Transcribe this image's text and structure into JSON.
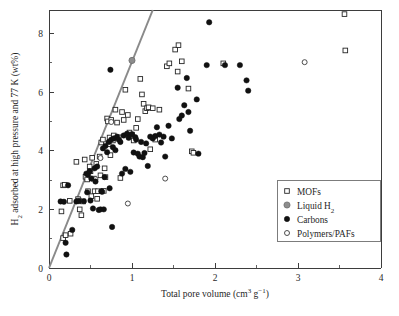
{
  "figure": {
    "background": "#ffffff",
    "plot_area": {
      "left": 49,
      "top": 10,
      "right": 381,
      "bottom": 268
    }
  },
  "chart_data": {
    "type": "scatter",
    "title": "",
    "xlabel": "Total pore volume (cm3 g-1)",
    "xlabel_parts": {
      "base": "Total pore volume (cm",
      "sup1": "3",
      "mid": " g",
      "sup2": "−1",
      "tail": ")"
    },
    "ylabel": "H2 adsorbed at high pressure and 77 K (wt%)",
    "ylabel_parts": {
      "lead": "H",
      "sub": "2",
      "rest": " adsorbed at high pressure and 77 K (wt%)"
    },
    "xlim": [
      0,
      4
    ],
    "ylim": [
      0,
      8.8
    ],
    "xticks": [
      0,
      1,
      2,
      3,
      4
    ],
    "xticklabels": [
      "0",
      "1",
      "2",
      "3",
      "4"
    ],
    "xminorticks": [
      0.5,
      1.5,
      2.5,
      3.5
    ],
    "yticks": [
      0,
      2,
      4,
      6,
      8
    ],
    "yticklabels": [
      "0",
      "2",
      "4",
      "6",
      "8"
    ],
    "yminorticks": [
      1,
      3,
      5,
      7
    ],
    "grid": false,
    "legend_position": "lower-right",
    "reference_line": {
      "name": "chahine-rule-line",
      "color": "#8a8a8a",
      "x": [
        0,
        1.25
      ],
      "y": [
        0,
        8.8
      ]
    },
    "series": [
      {
        "name": "MOFs",
        "marker": "open-square",
        "color": "#ffffff",
        "edge": "#262626",
        "points": [
          [
            0.15,
            1.93
          ],
          [
            0.17,
            2.82
          ],
          [
            0.19,
            2.84
          ],
          [
            0.17,
            1.02
          ],
          [
            0.2,
            1.12
          ],
          [
            0.25,
            2.29
          ],
          [
            0.26,
            1.17
          ],
          [
            0.33,
            3.62
          ],
          [
            0.35,
            2.35
          ],
          [
            0.36,
            2.3
          ],
          [
            0.37,
            2.0
          ],
          [
            0.39,
            1.8
          ],
          [
            0.41,
            2.27
          ],
          [
            0.43,
            3.7
          ],
          [
            0.44,
            3.11
          ],
          [
            0.46,
            3.02
          ],
          [
            0.47,
            2.62
          ],
          [
            0.49,
            3.46
          ],
          [
            0.5,
            3.3
          ],
          [
            0.51,
            2.45
          ],
          [
            0.52,
            3.76
          ],
          [
            0.54,
            3.05
          ],
          [
            0.55,
            2.62
          ],
          [
            0.57,
            3.55
          ],
          [
            0.58,
            2.36
          ],
          [
            0.59,
            2.62
          ],
          [
            0.61,
            3.8
          ],
          [
            0.62,
            3.16
          ],
          [
            0.63,
            4.28
          ],
          [
            0.65,
            4.38
          ],
          [
            0.66,
            2.63
          ],
          [
            0.67,
            3.4
          ],
          [
            0.68,
            3.1
          ],
          [
            0.7,
            5.1
          ],
          [
            0.71,
            5.0
          ],
          [
            0.72,
            4.22
          ],
          [
            0.73,
            4.45
          ],
          [
            0.74,
            3.85
          ],
          [
            0.75,
            5.05
          ],
          [
            0.77,
            4.35
          ],
          [
            0.78,
            4.52
          ],
          [
            0.8,
            5.4
          ],
          [
            0.82,
            4.96
          ],
          [
            0.84,
            4.46
          ],
          [
            0.86,
            3.07
          ],
          [
            0.88,
            5.32
          ],
          [
            0.9,
            5.05
          ],
          [
            0.92,
            6.08
          ],
          [
            0.95,
            5.22
          ],
          [
            0.97,
            4.62
          ],
          [
            1.0,
            4.55
          ],
          [
            1.02,
            4.35
          ],
          [
            1.05,
            4.78
          ],
          [
            1.07,
            5.08
          ],
          [
            1.1,
            6.45
          ],
          [
            1.12,
            5.92
          ],
          [
            1.14,
            5.6
          ],
          [
            1.16,
            5.35
          ],
          [
            1.18,
            5.45
          ],
          [
            1.2,
            5.48
          ],
          [
            1.22,
            4.05
          ],
          [
            1.25,
            5.45
          ],
          [
            1.28,
            4.38
          ],
          [
            1.33,
            5.4
          ],
          [
            1.42,
            6.88
          ],
          [
            1.45,
            6.98
          ],
          [
            1.52,
            7.45
          ],
          [
            1.55,
            6.7
          ],
          [
            1.56,
            7.6
          ],
          [
            1.6,
            7.05
          ],
          [
            1.68,
            6.12
          ],
          [
            1.72,
            3.98
          ],
          [
            1.74,
            3.93
          ],
          [
            2.1,
            6.98
          ],
          [
            3.56,
            8.66
          ],
          [
            3.57,
            7.42
          ]
        ]
      },
      {
        "name": "Liquid H2",
        "marker": "filled-circle-gray",
        "color": "#8d8d8d",
        "points": [
          [
            1.0,
            7.08
          ]
        ]
      },
      {
        "name": "Carbons",
        "marker": "filled-circle",
        "color": "#111111",
        "points": [
          [
            0.14,
            2.27
          ],
          [
            0.18,
            2.26
          ],
          [
            0.2,
            0.86
          ],
          [
            0.21,
            0.46
          ],
          [
            0.23,
            2.82
          ],
          [
            0.28,
            1.3
          ],
          [
            0.33,
            2.27
          ],
          [
            0.36,
            2.28
          ],
          [
            0.42,
            2.28
          ],
          [
            0.45,
            3.22
          ],
          [
            0.46,
            2.58
          ],
          [
            0.47,
            3.18
          ],
          [
            0.49,
            3.3
          ],
          [
            0.5,
            2.3
          ],
          [
            0.51,
            3.05
          ],
          [
            0.53,
            2.03
          ],
          [
            0.55,
            3.4
          ],
          [
            0.56,
            2.95
          ],
          [
            0.58,
            3.46
          ],
          [
            0.6,
            1.98
          ],
          [
            0.62,
            2.0
          ],
          [
            0.63,
            2.62
          ],
          [
            0.64,
            2.6
          ],
          [
            0.65,
            4.08
          ],
          [
            0.66,
            2.0
          ],
          [
            0.67,
            3.1
          ],
          [
            0.68,
            4.16
          ],
          [
            0.7,
            3.95
          ],
          [
            0.72,
            4.3
          ],
          [
            0.73,
            2.72
          ],
          [
            0.74,
            6.76
          ],
          [
            0.75,
            4.38
          ],
          [
            0.76,
            1.4
          ],
          [
            0.77,
            4.12
          ],
          [
            0.78,
            4.42
          ],
          [
            0.8,
            4.02
          ],
          [
            0.82,
            4.48
          ],
          [
            0.84,
            4.38
          ],
          [
            0.86,
            4.3
          ],
          [
            0.88,
            3.22
          ],
          [
            0.9,
            4.52
          ],
          [
            0.92,
            3.38
          ],
          [
            0.94,
            4.58
          ],
          [
            0.96,
            4.44
          ],
          [
            0.98,
            3.28
          ],
          [
            1.0,
            4.56
          ],
          [
            1.02,
            3.94
          ],
          [
            1.04,
            4.46
          ],
          [
            1.05,
            4.38
          ],
          [
            1.07,
            3.9
          ],
          [
            1.09,
            3.8
          ],
          [
            1.11,
            4.3
          ],
          [
            1.13,
            3.78
          ],
          [
            1.15,
            3.92
          ],
          [
            1.17,
            4.25
          ],
          [
            1.19,
            3.48
          ],
          [
            1.22,
            4.48
          ],
          [
            1.25,
            4.42
          ],
          [
            1.28,
            4.5
          ],
          [
            1.3,
            4.8
          ],
          [
            1.33,
            4.55
          ],
          [
            1.35,
            4.28
          ],
          [
            1.38,
            4.48
          ],
          [
            1.4,
            3.8
          ],
          [
            1.44,
            4.85
          ],
          [
            1.48,
            4.42
          ],
          [
            1.55,
            6.15
          ],
          [
            1.57,
            5.08
          ],
          [
            1.6,
            5.2
          ],
          [
            1.63,
            5.55
          ],
          [
            1.66,
            6.48
          ],
          [
            1.68,
            5.32
          ],
          [
            1.7,
            4.68
          ],
          [
            1.78,
            5.75
          ],
          [
            1.8,
            3.9
          ],
          [
            1.9,
            6.92
          ],
          [
            1.93,
            8.38
          ],
          [
            2.12,
            6.92
          ],
          [
            2.3,
            6.92
          ],
          [
            2.38,
            6.4
          ],
          [
            2.4,
            6.05
          ]
        ]
      },
      {
        "name": "Polymers/PAFs",
        "marker": "open-circle",
        "color": "#ffffff",
        "edge": "#3a3a3a",
        "points": [
          [
            0.56,
            3.03
          ],
          [
            0.62,
            3.75
          ],
          [
            0.75,
            4.98
          ],
          [
            0.95,
            2.2
          ],
          [
            1.0,
            7.08
          ],
          [
            1.4,
            3.05
          ],
          [
            3.08,
            7.02
          ]
        ]
      }
    ]
  },
  "legend": {
    "entries": [
      {
        "label": "MOFs",
        "marker": "open-square",
        "marker_name": "mof-marker-icon"
      },
      {
        "label": "Liquid H2",
        "label_base": "Liquid H",
        "label_sub": "2",
        "marker": "filled-circle-gray",
        "marker_name": "liquid-h2-marker-icon"
      },
      {
        "label": "Carbons",
        "marker": "filled-circle",
        "marker_name": "carbons-marker-icon"
      },
      {
        "label": "Polymers/PAFs",
        "marker": "open-circle",
        "marker_name": "polymers-pafs-marker-icon"
      }
    ]
  }
}
